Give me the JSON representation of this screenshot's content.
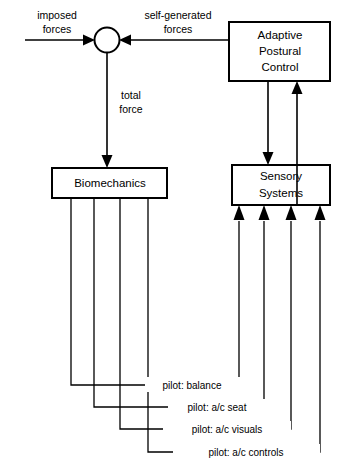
{
  "diagram": {
    "background_color": "#ffffff",
    "line_color": "#000000",
    "nodes": [
      {
        "id": "summing-junction",
        "type": "circle",
        "label": ""
      },
      {
        "id": "adaptive-postural-control",
        "type": "box",
        "label_lines": [
          "Adaptive",
          "Postural",
          "Control"
        ]
      },
      {
        "id": "biomechanics",
        "type": "box",
        "label_lines": [
          "Biomechanics"
        ]
      },
      {
        "id": "sensory-systems",
        "type": "box",
        "label_lines": [
          "Sensory",
          "Systems"
        ]
      }
    ],
    "node_labels": {
      "adaptive_line1": "Adaptive",
      "adaptive_line2": "Postural",
      "adaptive_line3": "Control",
      "biomechanics": "Biomechanics",
      "sensory_line1": "Sensory",
      "sensory_line2": "Systems"
    },
    "edge_labels": {
      "imposed_line1": "imposed",
      "imposed_line2": "forces",
      "self_generated_line1": "self-generated",
      "self_generated_line2": "forces",
      "total_line1": "total",
      "total_line2": "force"
    },
    "feedback_loops": [
      {
        "id": "loop-balance",
        "label": "pilot:  balance"
      },
      {
        "id": "loop-ac-seat",
        "label": "pilot:  a/c  seat"
      },
      {
        "id": "loop-ac-visuals",
        "label": "pilot:  a/c  visuals"
      },
      {
        "id": "loop-ac-controls",
        "label": "pilot:  a/c  controls"
      }
    ],
    "loop_label_0": "pilot:  balance",
    "loop_label_1": "pilot:  a/c  seat",
    "loop_label_2": "pilot:  a/c  visuals",
    "loop_label_3": "pilot:  a/c  controls"
  }
}
